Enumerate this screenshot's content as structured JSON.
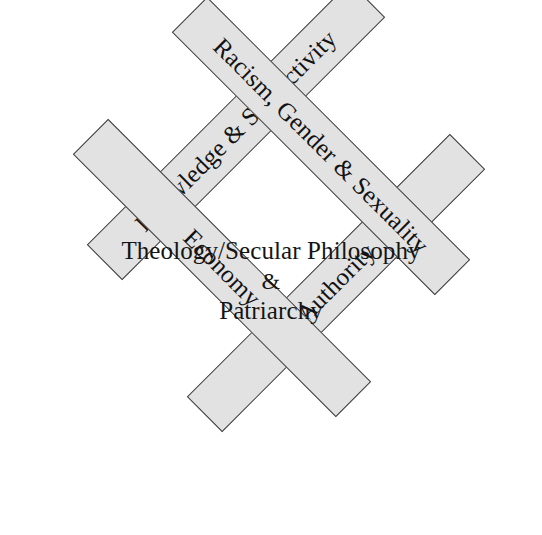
{
  "diagram": {
    "type": "diamond-framework",
    "shape": "rotated-square",
    "fill_color": "#e2e2e2",
    "border_color": "#3a3a3a",
    "text_color": "#141414",
    "bars": [
      {
        "id": "knowledge",
        "label": "Knowledge & Subjectivity",
        "side": "top-left",
        "rotation_deg": -45,
        "stacking_order": 1
      },
      {
        "id": "racism",
        "label": "Racism, Gender & Sexuality",
        "side": "top-right",
        "rotation_deg": 45,
        "stacking_order": 3
      },
      {
        "id": "economy",
        "label": "Economy",
        "side": "bottom-left",
        "rotation_deg": 45,
        "stacking_order": 4
      },
      {
        "id": "authority",
        "label": "Authority",
        "side": "bottom-right",
        "rotation_deg": -45,
        "stacking_order": 2
      }
    ],
    "center": {
      "line1": "Theology/Secular Philosophy",
      "line2": "&",
      "line3": "Patriarchy"
    }
  }
}
